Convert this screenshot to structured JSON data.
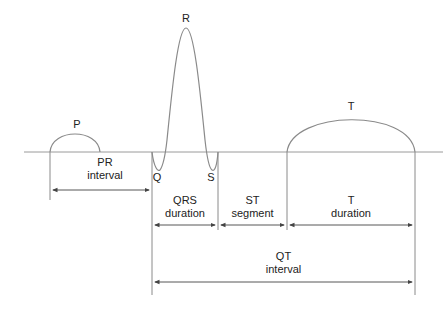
{
  "diagram": {
    "type": "ecg-waveform",
    "waves": {
      "p": "P",
      "q": "Q",
      "r": "R",
      "s": "S",
      "t": "T"
    },
    "intervals": {
      "pr": {
        "line1": "PR",
        "line2": "interval"
      },
      "qrs": {
        "line1": "QRS",
        "line2": "duration"
      },
      "st": {
        "line1": "ST",
        "line2": "segment"
      },
      "t": {
        "line1": "T",
        "line2": "duration"
      },
      "qt": {
        "line1": "QT",
        "line2": "interval"
      }
    },
    "colors": {
      "line": "#8a8a8a",
      "arrow": "#444444",
      "text": "#222222"
    }
  }
}
